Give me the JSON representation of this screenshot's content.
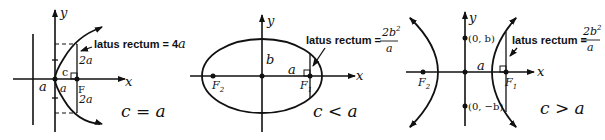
{
  "figures": [
    {
      "name": "parabola",
      "axis_x": "x",
      "axis_y": "y",
      "latus_label": "latus rectum = 4",
      "latus_var": "a",
      "upper_half": "2a",
      "lower_half": "2a",
      "c_label": "c",
      "a_left": "a",
      "a_right": "a",
      "focus": "F",
      "condition": "c = a"
    },
    {
      "name": "ellipse",
      "axis_x": "x",
      "axis_y": "y",
      "latus_label": "latus rectum =",
      "frac_num": "2b",
      "frac_exp": "2",
      "frac_den": "a",
      "b_label": "b",
      "a_label": "a",
      "f1": "F",
      "f1_sub": "1",
      "f2": "F",
      "f2_sub": "2",
      "condition": "c < a"
    },
    {
      "name": "hyperbola",
      "axis_x": "x",
      "axis_y": "y",
      "latus_label": "latus rectum =",
      "frac_num": "2b",
      "frac_exp": "2",
      "frac_den": "a",
      "vertex_top": "(0, b)",
      "vertex_bottom": "(0, −b)",
      "a_label": "a",
      "f1": "F",
      "f1_sub": "1",
      "f2": "F",
      "f2_sub": "2",
      "condition": "c > a"
    }
  ]
}
